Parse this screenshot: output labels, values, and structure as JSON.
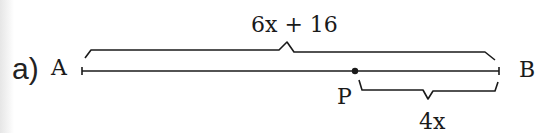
{
  "part_label": "a)",
  "points": {
    "A": "A",
    "B": "B",
    "P": "P"
  },
  "labels": {
    "total_length": "6x + 16",
    "segment_PB": "4x"
  },
  "colors": {
    "ink": "#1a1a1a",
    "background": "#ffffff"
  }
}
